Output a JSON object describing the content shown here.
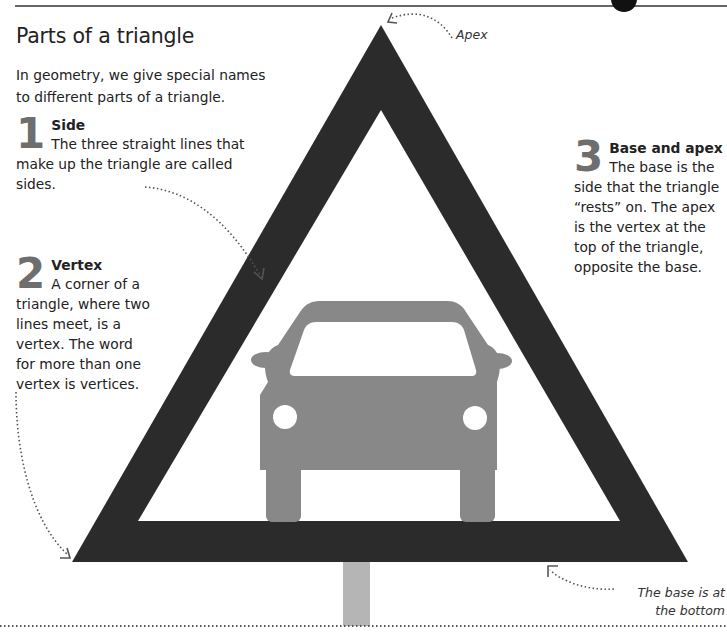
{
  "page": {
    "title": "Parts of a triangle",
    "intro": "In geometry, we give special names to different parts of a triangle."
  },
  "sections": [
    {
      "number": "1",
      "heading": "Side",
      "body": "The three straight lines that make up the triangle are called sides."
    },
    {
      "number": "2",
      "heading": "Vertex",
      "body": "A corner of a triangle, where two lines meet, is a vertex. The word for more than one vertex is vertices."
    },
    {
      "number": "3",
      "heading": "Base and apex",
      "body": "The base is the side that the triangle “rests” on. The apex is the vertex at the top of the triangle, opposite the base."
    }
  ],
  "annotations": {
    "apex": "Apex",
    "base": "The base is at the bottom"
  },
  "illustration": {
    "subject": "triangular warning road sign with car icon",
    "colors": {
      "sign_border": "#2b2b2b",
      "sign_inner": "#ffffff",
      "car": "#888888",
      "pole": "#b5b5b5",
      "number_gray": "#6e6e6e",
      "dotted_line": "#555555"
    }
  }
}
